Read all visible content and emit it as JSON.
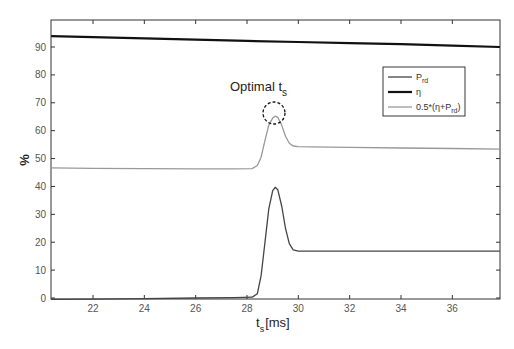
{
  "chart_data": {
    "type": "line",
    "title": "",
    "xlabel": "t_s [ms]",
    "xlabel_main": "t",
    "xlabel_sub": "s",
    "xlabel_unit": "[ms]",
    "ylabel": "%",
    "xlim": [
      20.37,
      37.85
    ],
    "ylim": [
      0,
      97.5
    ],
    "xticks": [
      22,
      24,
      26,
      28,
      30,
      32,
      34,
      36
    ],
    "yticks": [
      0,
      10,
      20,
      30,
      40,
      50,
      60,
      70,
      80,
      90
    ],
    "grid": false,
    "legend_position": "upper right (inside)",
    "legend": [
      {
        "label_main": "P",
        "label_sub": "rd",
        "label_tail": "",
        "label_full": "P_rd",
        "color": "#444444",
        "width": 1.3
      },
      {
        "label_main": "η",
        "label_sub": "",
        "label_tail": "",
        "label_full": "η",
        "color": "#111111",
        "width": 2.2
      },
      {
        "label_main": "0.5*(η+P",
        "label_sub": "rd",
        "label_tail": ")",
        "label_full": "0.5*(η+P_rd)",
        "color": "#999999",
        "width": 1.3
      }
    ],
    "series": [
      {
        "name": "P_rd",
        "color": "#444444",
        "width": 1.3,
        "x": [
          20.37,
          22,
          24,
          26,
          27.5,
          28.2,
          28.4,
          28.55,
          28.7,
          28.85,
          29.0,
          29.1,
          29.2,
          29.35,
          29.5,
          29.65,
          29.8,
          30.0,
          30.5,
          32,
          34,
          36,
          37.85
        ],
        "y": [
          -0.5,
          -0.4,
          -0.2,
          0.0,
          0.1,
          0.3,
          1.5,
          8,
          20,
          32,
          38.5,
          39.7,
          38.8,
          33,
          25,
          19.5,
          17.3,
          16.8,
          16.8,
          16.8,
          16.8,
          16.8,
          16.8
        ]
      },
      {
        "name": "η",
        "color": "#111111",
        "width": 2.2,
        "x": [
          20.37,
          22,
          24,
          26,
          28,
          30,
          32,
          34,
          36,
          37.85
        ],
        "y": [
          93.9,
          93.5,
          93.1,
          92.6,
          92.2,
          91.8,
          91.4,
          91.0,
          90.5,
          90.0
        ]
      },
      {
        "name": "0.5*(η+P_rd)",
        "color": "#999999",
        "width": 1.3,
        "x": [
          20.37,
          22,
          24,
          26,
          27.5,
          28.2,
          28.4,
          28.55,
          28.7,
          28.85,
          29.0,
          29.1,
          29.2,
          29.35,
          29.5,
          29.65,
          29.8,
          30.0,
          30.5,
          32,
          34,
          36,
          37.85
        ],
        "y": [
          46.7,
          46.5,
          46.4,
          46.3,
          46.3,
          46.4,
          47.5,
          50.5,
          56.5,
          62,
          64.5,
          65.2,
          64.8,
          62,
          58,
          55.5,
          54.5,
          54.3,
          54.2,
          54.0,
          53.8,
          53.6,
          53.4
        ]
      }
    ],
    "annotations": [
      {
        "text_main": "Optimal t",
        "text_sub": "s",
        "text_full": "Optimal t_s",
        "x": 29.1,
        "y": 65.2,
        "marker": "dashed circle"
      }
    ]
  }
}
